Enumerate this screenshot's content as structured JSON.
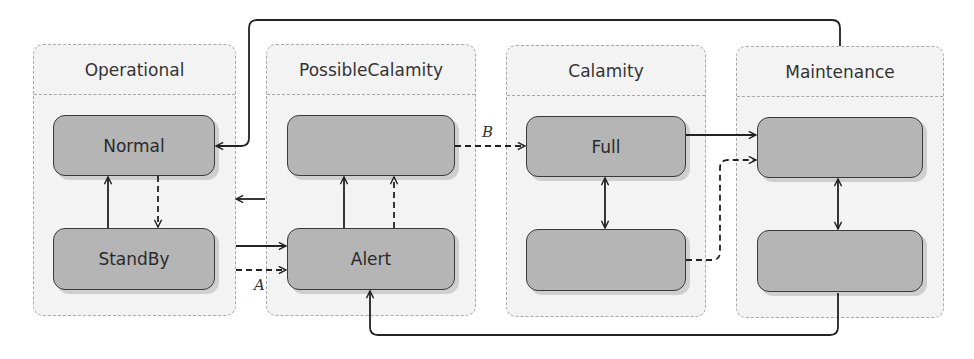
{
  "diagram": {
    "containers": [
      {
        "id": "operational",
        "title": "Operational"
      },
      {
        "id": "possible_calamity",
        "title": "PossibleCalamity"
      },
      {
        "id": "calamity",
        "title": "Calamity"
      },
      {
        "id": "maintenance",
        "title": "Maintenance"
      }
    ],
    "nodes": {
      "normal": {
        "label": "Normal"
      },
      "standby": {
        "label": "StandBy"
      },
      "pc_top": {
        "label": ""
      },
      "alert": {
        "label": "Alert"
      },
      "full": {
        "label": "Full"
      },
      "cal_bottom": {
        "label": ""
      },
      "maint_top": {
        "label": ""
      },
      "maint_bottom": {
        "label": ""
      }
    },
    "edge_labels": {
      "a": "A",
      "b": "B"
    },
    "edges": [
      {
        "from": "standby",
        "to": "normal",
        "style": "solid"
      },
      {
        "from": "normal",
        "to": "standby",
        "style": "dashed"
      },
      {
        "from": "standby",
        "to": "alert",
        "style": "solid"
      },
      {
        "from": "standby",
        "to": "alert",
        "style": "dashed",
        "label": "A"
      },
      {
        "from": "possible_calamity",
        "to": "operational",
        "style": "solid"
      },
      {
        "from": "alert",
        "to": "pc_top",
        "style": "solid"
      },
      {
        "from": "alert",
        "to": "pc_top",
        "style": "dashed"
      },
      {
        "from": "pc_top",
        "to": "full",
        "style": "dashed",
        "label": "B"
      },
      {
        "from": "full",
        "to": "cal_bottom",
        "style": "solid-bidirectional"
      },
      {
        "from": "full",
        "to": "maint_top",
        "style": "solid"
      },
      {
        "from": "cal_bottom",
        "to": "maint_top",
        "style": "dashed"
      },
      {
        "from": "maint_top",
        "to": "maint_bottom",
        "style": "solid-bidirectional"
      },
      {
        "from": "maintenance",
        "to": "normal",
        "style": "solid"
      },
      {
        "from": "maint_bottom",
        "to": "alert",
        "style": "solid"
      }
    ]
  }
}
